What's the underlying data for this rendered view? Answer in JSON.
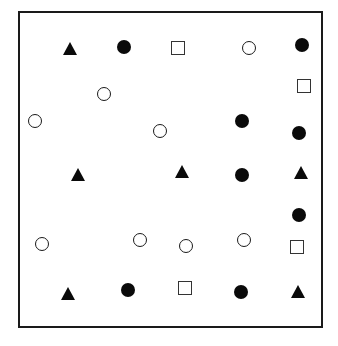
{
  "diagram": {
    "frame": {
      "left": 18,
      "top": 11,
      "width": 305,
      "height": 317
    },
    "colors": {
      "ink": "#0a0a0a",
      "stroke": "#1a1a1a",
      "background": "#ffffff"
    },
    "shapes": [
      {
        "type": "filled-triangle",
        "x": 70,
        "y": 49
      },
      {
        "type": "filled-circle",
        "x": 124,
        "y": 47
      },
      {
        "type": "open-square",
        "x": 178,
        "y": 48
      },
      {
        "type": "open-circle",
        "x": 249,
        "y": 48
      },
      {
        "type": "filled-circle",
        "x": 302,
        "y": 45
      },
      {
        "type": "open-circle",
        "x": 104,
        "y": 94
      },
      {
        "type": "open-square",
        "x": 304,
        "y": 86
      },
      {
        "type": "open-circle",
        "x": 35,
        "y": 121
      },
      {
        "type": "open-circle",
        "x": 160,
        "y": 131
      },
      {
        "type": "filled-circle",
        "x": 242,
        "y": 121
      },
      {
        "type": "filled-circle",
        "x": 299,
        "y": 133
      },
      {
        "type": "filled-triangle",
        "x": 78,
        "y": 175
      },
      {
        "type": "filled-triangle",
        "x": 182,
        "y": 172
      },
      {
        "type": "filled-circle",
        "x": 242,
        "y": 175
      },
      {
        "type": "filled-triangle",
        "x": 301,
        "y": 173
      },
      {
        "type": "filled-circle",
        "x": 299,
        "y": 215
      },
      {
        "type": "open-circle",
        "x": 42,
        "y": 244
      },
      {
        "type": "open-circle",
        "x": 140,
        "y": 240
      },
      {
        "type": "open-circle",
        "x": 186,
        "y": 246
      },
      {
        "type": "open-circle",
        "x": 244,
        "y": 240
      },
      {
        "type": "open-square",
        "x": 297,
        "y": 247
      },
      {
        "type": "filled-triangle",
        "x": 68,
        "y": 294
      },
      {
        "type": "filled-circle",
        "x": 128,
        "y": 290
      },
      {
        "type": "open-square",
        "x": 185,
        "y": 288
      },
      {
        "type": "filled-circle",
        "x": 241,
        "y": 292
      },
      {
        "type": "filled-triangle",
        "x": 298,
        "y": 292
      }
    ],
    "counts": {
      "filled-circle": 9,
      "open-circle": 8,
      "filled-triangle": 6,
      "open-square": 4
    }
  }
}
